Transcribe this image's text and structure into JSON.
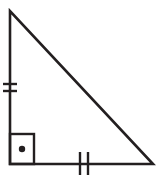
{
  "figure": {
    "name": "right-triangle-isosceles",
    "background_color": "#ffffff",
    "stroke_color": "#231f20",
    "canvas": {
      "width": 159,
      "height": 179
    },
    "triangle": {
      "vertices": {
        "apex": {
          "x": 10,
          "y": 11
        },
        "bottom_left": {
          "x": 10,
          "y": 164
        },
        "bottom_right": {
          "x": 153,
          "y": 164
        }
      },
      "points": "10,11 10,164 153,164",
      "stroke_width": 2.6
    },
    "right_angle_marker": {
      "name": "right-angle-square",
      "x": 10,
      "y": 134,
      "width": 24,
      "height": 30,
      "stroke_width": 2.4,
      "dot": {
        "cx": 22,
        "cy": 149,
        "r": 3.2
      }
    },
    "tick_marks": {
      "vertical_leg": {
        "name": "congruence-ticks-left-leg",
        "count": 2,
        "orientation": "horizontal",
        "x1": 3,
        "x2": 17,
        "stroke_width": 2.4,
        "y_positions": [
          84,
          91
        ]
      },
      "horizontal_leg": {
        "name": "congruence-ticks-bottom-leg",
        "count": 2,
        "orientation": "vertical",
        "y1": 152,
        "y2": 175,
        "stroke_width": 2.4,
        "x_positions": [
          80,
          88
        ]
      }
    }
  }
}
